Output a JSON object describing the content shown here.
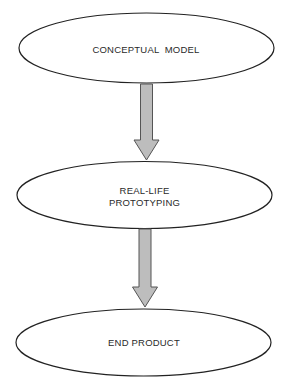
{
  "diagram": {
    "type": "vertical-flowchart",
    "colors": {
      "background": "#ffffff",
      "node_stroke": "#222222",
      "node_fill": "#ffffff",
      "arrow_fill": "#bdbdbd",
      "arrow_stroke": "#555555",
      "text": "#2a2a2a"
    },
    "nodes": [
      {
        "id": "conceptual-model",
        "shape": "ellipse",
        "lines": [
          "CONCEPTUAL  MODEL"
        ]
      },
      {
        "id": "real-life-prototyping",
        "shape": "ellipse",
        "lines": [
          "REAL-LIFE",
          "PROTOTYPING"
        ]
      },
      {
        "id": "end-product",
        "shape": "ellipse",
        "lines": [
          "END PRODUCT"
        ]
      }
    ],
    "edges": [
      {
        "from": "conceptual-model",
        "to": "real-life-prototyping",
        "style": "block-arrow"
      },
      {
        "from": "real-life-prototyping",
        "to": "end-product",
        "style": "block-arrow"
      }
    ]
  }
}
